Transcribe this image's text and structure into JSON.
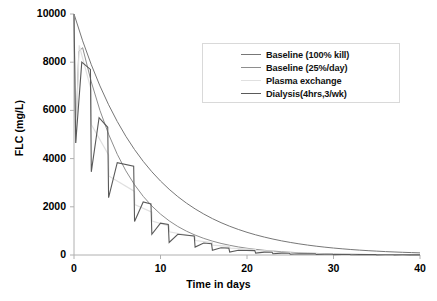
{
  "chart_data": {
    "type": "line",
    "title": "",
    "xlabel": "Time in days",
    "ylabel": "FLC (mg/L)",
    "xlim": [
      0,
      40
    ],
    "ylim": [
      0,
      10000
    ],
    "xticks": [
      0,
      10,
      20,
      30,
      40
    ],
    "yticks": [
      0,
      2000,
      4000,
      6000,
      8000,
      10000
    ],
    "xtick_labels": [
      "0",
      "10",
      "20",
      "30",
      "40"
    ],
    "ytick_labels": [
      "0",
      "2000",
      "4000",
      "6000",
      "8000",
      "10000"
    ],
    "grid": false,
    "legend_position": "upper-center-right",
    "background": "#ffffff",
    "axis_color": "#b0b0b0",
    "series": [
      {
        "name": "Baseline (100% kill)",
        "color": "#777777",
        "width": 1.0,
        "kind": "smooth",
        "start": 10000,
        "decay_per_day": 0.118,
        "points": [
          [
            0,
            10000
          ],
          [
            1,
            8886
          ],
          [
            2,
            7896
          ],
          [
            3,
            7016
          ],
          [
            4,
            6234
          ],
          [
            5,
            5540
          ],
          [
            6,
            4923
          ],
          [
            7,
            4374
          ],
          [
            8,
            3887
          ],
          [
            9,
            3454
          ],
          [
            10,
            3069
          ],
          [
            11,
            2727
          ],
          [
            12,
            2423
          ],
          [
            13,
            2153
          ],
          [
            14,
            1913
          ],
          [
            15,
            1700
          ],
          [
            16,
            1510
          ],
          [
            17,
            1342
          ],
          [
            18,
            1193
          ],
          [
            19,
            1060
          ],
          [
            20,
            942
          ],
          [
            21,
            837
          ],
          [
            22,
            744
          ],
          [
            23,
            661
          ],
          [
            24,
            587
          ],
          [
            25,
            522
          ],
          [
            26,
            464
          ],
          [
            27,
            412
          ],
          [
            28,
            366
          ],
          [
            29,
            325
          ],
          [
            30,
            289
          ],
          [
            31,
            257
          ],
          [
            32,
            228
          ],
          [
            33,
            203
          ],
          [
            34,
            180
          ],
          [
            35,
            160
          ],
          [
            36,
            142
          ],
          [
            37,
            126
          ],
          [
            38,
            112
          ],
          [
            39,
            100
          ],
          [
            40,
            89
          ]
        ]
      },
      {
        "name": "Baseline (25%/day)",
        "color": "#8e8e8e",
        "width": 1.0,
        "kind": "smooth-spike",
        "start": 10000,
        "spike_low": 4650,
        "points": [
          [
            0,
            10000
          ],
          [
            0.18,
            4650
          ],
          [
            0.55,
            8450
          ],
          [
            1,
            8600
          ],
          [
            2,
            7180
          ],
          [
            3,
            6000
          ],
          [
            4,
            5010
          ],
          [
            5,
            4180
          ],
          [
            6,
            3490
          ],
          [
            7,
            2915
          ],
          [
            8,
            2435
          ],
          [
            9,
            2033
          ],
          [
            10,
            1698
          ],
          [
            11,
            1418
          ],
          [
            12,
            1184
          ],
          [
            13,
            989
          ],
          [
            14,
            826
          ],
          [
            15,
            690
          ],
          [
            16,
            576
          ],
          [
            17,
            481
          ],
          [
            18,
            402
          ],
          [
            19,
            335
          ],
          [
            20,
            280
          ],
          [
            21,
            234
          ],
          [
            22,
            195
          ],
          [
            23,
            163
          ],
          [
            24,
            136
          ],
          [
            25,
            114
          ],
          [
            26,
            95
          ],
          [
            27,
            79
          ],
          [
            28,
            66
          ],
          [
            29,
            55
          ],
          [
            30,
            46
          ],
          [
            31,
            38
          ],
          [
            32,
            32
          ],
          [
            33,
            27
          ],
          [
            34,
            22
          ],
          [
            35,
            19
          ],
          [
            36,
            16
          ],
          [
            37,
            13
          ],
          [
            38,
            11
          ],
          [
            39,
            9
          ],
          [
            40,
            8
          ]
        ]
      },
      {
        "name": "Plasma exchange",
        "color": "#e0e0e0",
        "width": 1.2,
        "kind": "step-drop",
        "start": 10000,
        "exchange_days": [
          0,
          2,
          4,
          7,
          9,
          11,
          14,
          16,
          18,
          21,
          23,
          25,
          28,
          30,
          32,
          35,
          37,
          39
        ],
        "points": [
          [
            0,
            10000
          ],
          [
            0.2,
            4650
          ],
          [
            0.6,
            8700
          ],
          [
            2,
            6820
          ],
          [
            2.02,
            5400
          ],
          [
            4,
            4150
          ],
          [
            4.02,
            3280
          ],
          [
            7,
            2640
          ],
          [
            7.02,
            2090
          ],
          [
            9,
            1780
          ],
          [
            9.02,
            1410
          ],
          [
            11,
            1210
          ],
          [
            11.02,
            960
          ],
          [
            14,
            760
          ],
          [
            14.02,
            600
          ],
          [
            16,
            520
          ],
          [
            16.02,
            410
          ],
          [
            18,
            360
          ],
          [
            18.02,
            285
          ],
          [
            21,
            230
          ],
          [
            21.02,
            182
          ],
          [
            23,
            158
          ],
          [
            23.02,
            125
          ],
          [
            25,
            110
          ],
          [
            25.02,
            87
          ],
          [
            28,
            70
          ],
          [
            28.02,
            55
          ],
          [
            30,
            48
          ],
          [
            30.02,
            38
          ],
          [
            32,
            34
          ],
          [
            32.02,
            27
          ],
          [
            35,
            21
          ],
          [
            35.02,
            17
          ],
          [
            37,
            15
          ],
          [
            37.02,
            12
          ],
          [
            39,
            10
          ],
          [
            39.02,
            8
          ],
          [
            40,
            7
          ]
        ]
      },
      {
        "name": "Dialysis(4hrs,3/wk)",
        "color": "#5a5a5a",
        "width": 1.1,
        "kind": "sawtooth",
        "start": 10000,
        "session_days": [
          0,
          2,
          4,
          7,
          9,
          11,
          14,
          16,
          18,
          21,
          23,
          25,
          28,
          30,
          32,
          35,
          37,
          39
        ],
        "points": [
          [
            0,
            10000
          ],
          [
            0.2,
            4650
          ],
          [
            0.9,
            8000
          ],
          [
            1.9,
            7700
          ],
          [
            2.0,
            3450
          ],
          [
            2.9,
            5700
          ],
          [
            3.9,
            5300
          ],
          [
            4.0,
            2380
          ],
          [
            5.0,
            3830
          ],
          [
            6.9,
            3680
          ],
          [
            7.0,
            1390
          ],
          [
            8.0,
            2200
          ],
          [
            8.9,
            2120
          ],
          [
            9.0,
            860
          ],
          [
            10.0,
            1320
          ],
          [
            10.9,
            1270
          ],
          [
            11.0,
            520
          ],
          [
            12.0,
            860
          ],
          [
            13.9,
            790
          ],
          [
            14.0,
            330
          ],
          [
            15.0,
            500
          ],
          [
            15.9,
            470
          ],
          [
            16.0,
            200
          ],
          [
            17.0,
            300
          ],
          [
            17.9,
            285
          ],
          [
            18.0,
            125
          ],
          [
            19.0,
            195
          ],
          [
            20.9,
            180
          ],
          [
            21.0,
            78
          ],
          [
            22.0,
            120
          ],
          [
            22.9,
            115
          ],
          [
            23.0,
            50
          ],
          [
            24.0,
            78
          ],
          [
            24.9,
            74
          ],
          [
            25.0,
            33
          ],
          [
            26.0,
            52
          ],
          [
            27.9,
            48
          ],
          [
            28.0,
            22
          ],
          [
            29.0,
            34
          ],
          [
            29.9,
            32
          ],
          [
            30.0,
            15
          ],
          [
            31.0,
            23
          ],
          [
            31.9,
            22
          ],
          [
            32.0,
            10
          ],
          [
            33.0,
            16
          ],
          [
            34.9,
            15
          ],
          [
            35.0,
            7
          ],
          [
            36.0,
            11
          ],
          [
            36.9,
            10
          ],
          [
            37.0,
            5
          ],
          [
            38.0,
            8
          ],
          [
            38.9,
            7
          ],
          [
            39.0,
            4
          ],
          [
            40.0,
            6
          ]
        ]
      }
    ]
  },
  "caption": {
    "partial_text": ""
  }
}
